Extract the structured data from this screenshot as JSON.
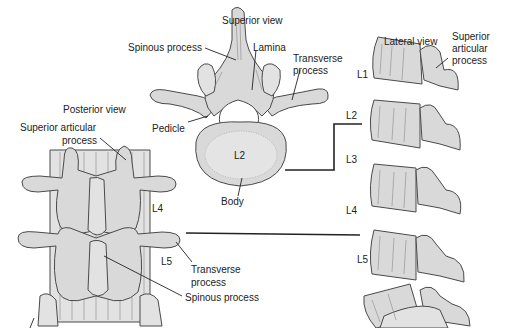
{
  "figure": {
    "views": {
      "superior": {
        "title": "Superior view",
        "labels": {
          "spinous_process": "Spinous process",
          "lamina": "Lamina",
          "transverse_process_1": "Transverse",
          "transverse_process_2": "process",
          "pedicle": "Pedicle",
          "body": "Body",
          "vertebra": "L2"
        }
      },
      "lateral": {
        "title": "Lateral view",
        "labels": {
          "sap_1": "Superior",
          "sap_2": "articular",
          "sap_3": "process"
        },
        "vertebrae": [
          "L1",
          "L2",
          "L3",
          "L4",
          "L5"
        ]
      },
      "posterior": {
        "title": "Posterior view",
        "labels": {
          "sap_1": "Superior articular",
          "sap_2": "process",
          "l4": "L4",
          "l5": "L5",
          "transverse_1": "Transverse",
          "transverse_2": "process",
          "spinous_process": "Spinous process"
        }
      }
    }
  }
}
